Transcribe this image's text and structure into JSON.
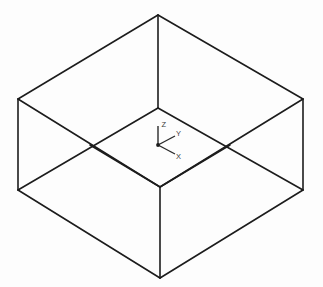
{
  "canvas": {
    "width": 323,
    "height": 287,
    "background_color": "#fdfdfd",
    "line_color": "#1c1c1c",
    "line_width": 1.6
  },
  "figure": {
    "projection": "isometric",
    "shading": "none",
    "style": "line drawing"
  },
  "geometry": {
    "outer_silhouette": {
      "name": "hexagonal outline of box",
      "points": "158,15 303,99 303,190 160,278 18,190 18,99"
    },
    "edges": [
      {
        "name": "top-rim-back-left",
        "x1": 18,
        "y1": 99,
        "x2": 158,
        "y2": 15
      },
      {
        "name": "top-rim-back-right",
        "x1": 158,
        "y1": 15,
        "x2": 303,
        "y2": 99
      },
      {
        "name": "top-rim-front-left",
        "x1": 18,
        "y1": 99,
        "x2": 160,
        "y2": 187
      },
      {
        "name": "top-rim-front-right",
        "x1": 303,
        "y1": 99,
        "x2": 160,
        "y2": 187
      },
      {
        "name": "floor-back-left",
        "x1": 90,
        "y1": 145,
        "x2": 158,
        "y2": 108
      },
      {
        "name": "floor-back-right",
        "x1": 158,
        "y1": 108,
        "x2": 230,
        "y2": 145
      },
      {
        "name": "floor-front-left",
        "x1": 90,
        "y1": 145,
        "x2": 160,
        "y2": 187
      },
      {
        "name": "floor-front-right",
        "x1": 230,
        "y1": 145,
        "x2": 160,
        "y2": 187
      },
      {
        "name": "wall-edge-left",
        "x1": 18,
        "y1": 99,
        "x2": 18,
        "y2": 190
      },
      {
        "name": "wall-edge-right",
        "x1": 303,
        "y1": 99,
        "x2": 303,
        "y2": 190
      },
      {
        "name": "wall-edge-back-center",
        "x1": 158,
        "y1": 15,
        "x2": 158,
        "y2": 108
      },
      {
        "name": "wall-edge-front-center",
        "x1": 160,
        "y1": 187,
        "x2": 160,
        "y2": 278
      },
      {
        "name": "bottom-rim-left",
        "x1": 18,
        "y1": 190,
        "x2": 160,
        "y2": 278
      },
      {
        "name": "bottom-rim-right",
        "x1": 303,
        "y1": 190,
        "x2": 160,
        "y2": 278
      },
      {
        "name": "bottom-rim-back-left",
        "x1": 18,
        "y1": 190,
        "x2": 158,
        "y2": 108
      },
      {
        "name": "bottom-rim-back-right",
        "x1": 303,
        "y1": 190,
        "x2": 158,
        "y2": 108
      }
    ],
    "vertices": [
      {
        "name": "top-apex",
        "x": 158,
        "y": 15
      },
      {
        "name": "left-upper",
        "x": 18,
        "y": 99
      },
      {
        "name": "right-upper",
        "x": 303,
        "y": 99
      },
      {
        "name": "left-lower",
        "x": 18,
        "y": 190
      },
      {
        "name": "right-lower",
        "x": 303,
        "y": 190
      },
      {
        "name": "bottom-apex",
        "x": 160,
        "y": 278
      },
      {
        "name": "floor-back-corner",
        "x": 158,
        "y": 108
      },
      {
        "name": "floor-left-corner",
        "x": 90,
        "y": 145
      },
      {
        "name": "floor-right-corner",
        "x": 230,
        "y": 145
      },
      {
        "name": "floor-front-corner",
        "x": 160,
        "y": 187
      }
    ]
  },
  "axis_triad": {
    "name": "coordinate system indicator",
    "origin": {
      "x": 158,
      "y": 145
    },
    "origin_dot_radius": 1.9,
    "color": "#2a2a2a",
    "label_color": "#3a3a3a",
    "label_font_size": 7.5,
    "axes": [
      {
        "id": "z",
        "label": "Z",
        "direction": "up",
        "tip": {
          "x": 158,
          "y": 126
        },
        "label_pos": {
          "x": 161.5,
          "y": 126
        }
      },
      {
        "id": "y",
        "label": "Y",
        "direction": "upper-right",
        "tip": {
          "x": 175,
          "y": 136
        },
        "label_pos": {
          "x": 176,
          "y": 135
        }
      },
      {
        "id": "x",
        "label": "X",
        "direction": "lower-right",
        "tip": {
          "x": 175,
          "y": 154
        },
        "label_pos": {
          "x": 176,
          "y": 158
        }
      }
    ]
  }
}
